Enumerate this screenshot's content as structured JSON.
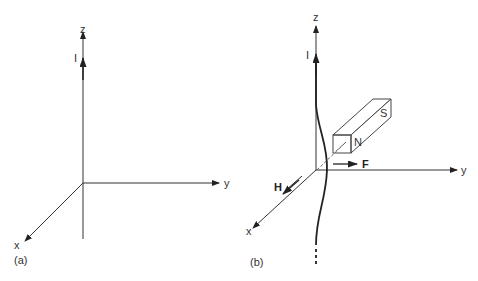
{
  "panel_a": {
    "caption": "(a)",
    "axes": {
      "x": "x",
      "y": "y",
      "z": "z"
    },
    "current_label": "I"
  },
  "panel_b": {
    "caption": "(b)",
    "axes": {
      "x": "x",
      "y": "y",
      "z": "z"
    },
    "current_label": "I",
    "magnet": {
      "north_label": "N",
      "south_label": "S"
    },
    "force_label": "F",
    "field_label": "H"
  },
  "colors": {
    "line": "#333333",
    "background": "#ffffff"
  }
}
